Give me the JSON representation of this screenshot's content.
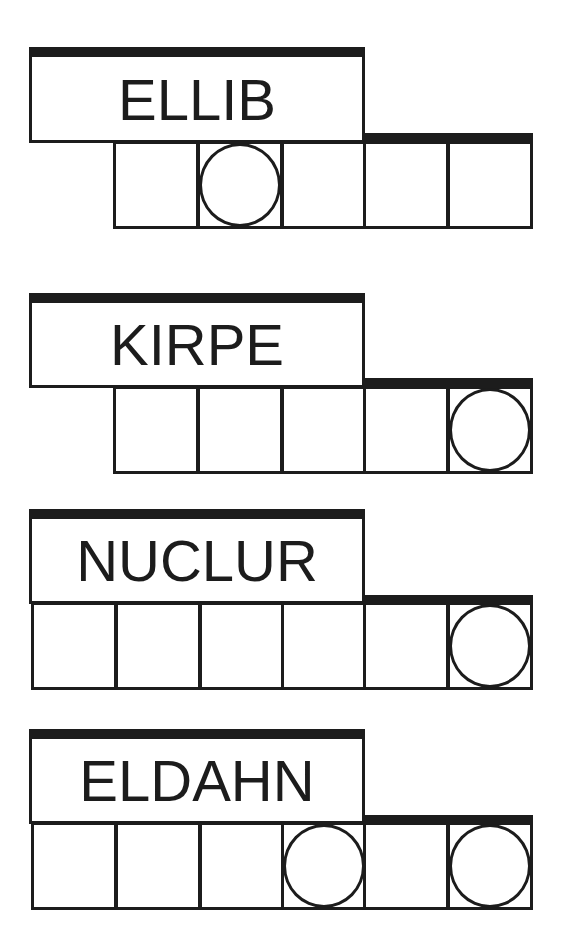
{
  "puzzles": [
    {
      "scrambled_word": "ELLIB",
      "box": {
        "left": 29,
        "top": 47,
        "width": 336,
        "height": 96
      },
      "right_bar": {
        "left": 363,
        "top": 133,
        "width": 170
      },
      "cells": [
        {
          "left": 113,
          "top": 141,
          "circled": false
        },
        {
          "left": 197,
          "top": 141,
          "circled": true
        },
        {
          "left": 281,
          "top": 141,
          "circled": false
        },
        {
          "left": 363,
          "top": 141,
          "circled": false
        },
        {
          "left": 447,
          "top": 141,
          "circled": false
        }
      ]
    },
    {
      "scrambled_word": "KIRPE",
      "box": {
        "left": 29,
        "top": 293,
        "width": 336,
        "height": 95
      },
      "right_bar": {
        "left": 363,
        "top": 378,
        "width": 170
      },
      "cells": [
        {
          "left": 113,
          "top": 386,
          "circled": false
        },
        {
          "left": 197,
          "top": 386,
          "circled": false
        },
        {
          "left": 281,
          "top": 386,
          "circled": false
        },
        {
          "left": 363,
          "top": 386,
          "circled": false
        },
        {
          "left": 447,
          "top": 386,
          "circled": true
        }
      ]
    },
    {
      "scrambled_word": "NUCLUR",
      "box": {
        "left": 29,
        "top": 509,
        "width": 336,
        "height": 95
      },
      "right_bar": {
        "left": 363,
        "top": 595,
        "width": 170
      },
      "cells": [
        {
          "left": 31,
          "top": 602,
          "circled": false
        },
        {
          "left": 115,
          "top": 602,
          "circled": false
        },
        {
          "left": 199,
          "top": 602,
          "circled": false
        },
        {
          "left": 281,
          "top": 602,
          "circled": false
        },
        {
          "left": 363,
          "top": 602,
          "circled": false
        },
        {
          "left": 447,
          "top": 602,
          "circled": true
        }
      ]
    },
    {
      "scrambled_word": "ELDAHN",
      "box": {
        "left": 29,
        "top": 729,
        "width": 336,
        "height": 95
      },
      "right_bar": {
        "left": 363,
        "top": 815,
        "width": 170
      },
      "cells": [
        {
          "left": 31,
          "top": 822,
          "circled": false
        },
        {
          "left": 115,
          "top": 822,
          "circled": false
        },
        {
          "left": 199,
          "top": 822,
          "circled": false
        },
        {
          "left": 281,
          "top": 822,
          "circled": true
        },
        {
          "left": 363,
          "top": 822,
          "circled": false
        },
        {
          "left": 447,
          "top": 822,
          "circled": true
        }
      ]
    }
  ],
  "cell_size": {
    "width": 86,
    "height": 88
  },
  "colors": {
    "ink": "#1c1c1c",
    "background": "#ffffff"
  }
}
